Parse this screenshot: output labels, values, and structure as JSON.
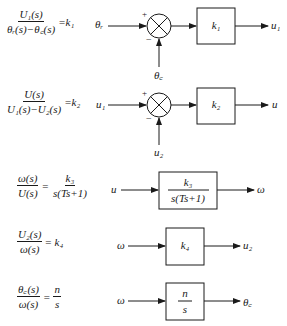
{
  "equations": [
    {
      "id": "eq1",
      "num": "U₁(s)",
      "den": "θᵣ(s)−θ꜀(s)",
      "rhs": "=k₁"
    },
    {
      "id": "eq2",
      "num": "U(s)",
      "den": "U₁(s)−U₂(s)",
      "rhs": "=k₂"
    },
    {
      "id": "eq3",
      "num": "ω(s)",
      "den": "U(s)",
      "rhs_num": "k₃",
      "rhs_den": "s(Ts+1)"
    },
    {
      "id": "eq4",
      "num": "U₂(s)",
      "den": "ω(s)",
      "rhs": "= k₄"
    },
    {
      "id": "eq5",
      "num": "θ꜀(s)",
      "den": "ω(s)",
      "rhs_num": "n",
      "rhs_den": "s"
    }
  ],
  "diagrams": [
    {
      "id": "d1",
      "input": "θᵣ",
      "feedback": "θ꜀",
      "plus": "+",
      "minus": "−",
      "block": "k₁",
      "output": "u₁"
    },
    {
      "id": "d2",
      "input": "u₁",
      "feedback": "u₂",
      "plus": "+",
      "minus": "−",
      "block": "k₂",
      "output": "u"
    },
    {
      "id": "d3",
      "input": "u",
      "block_num": "k₃",
      "block_den": "s(Ts+1)",
      "output": "ω"
    },
    {
      "id": "d4",
      "input": "ω",
      "block": "k₄",
      "output": "u₂"
    },
    {
      "id": "d5",
      "input": "ω",
      "block_num": "n",
      "block_den": "s",
      "output": "θ꜀"
    }
  ],
  "colors": {
    "ink": "#1a1a1a",
    "background": "#ffffff"
  }
}
